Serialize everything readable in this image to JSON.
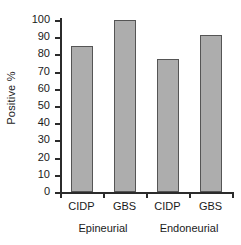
{
  "chart_data": {
    "type": "bar",
    "title": "",
    "xlabel": "",
    "ylabel": "Positive %",
    "ylim": [
      0,
      100
    ],
    "grid": false,
    "legend": "none",
    "categories": [
      "CIDP",
      "GBS",
      "CIDP",
      "GBS"
    ],
    "groups": [
      {
        "label": "Epineurial",
        "categories": [
          "CIDP",
          "GBS"
        ],
        "values": [
          85,
          100
        ]
      },
      {
        "label": "Endoneurial",
        "categories": [
          "CIDP",
          "GBS"
        ],
        "values": [
          77.5,
          91
        ]
      }
    ],
    "values": [
      85,
      100,
      77.5,
      91
    ],
    "bars": [
      {
        "category": "CIDP",
        "group": "Epineurial",
        "value": 85
      },
      {
        "category": "GBS",
        "group": "Epineurial",
        "value": 100
      },
      {
        "category": "CIDP",
        "group": "Endoneurial",
        "value": 77.5
      },
      {
        "category": "GBS",
        "group": "Endoneurial",
        "value": 91
      }
    ],
    "yticks": [
      100,
      90,
      80,
      70,
      60,
      50,
      40,
      30,
      20,
      10,
      0
    ],
    "ytick_labels": [
      "100",
      "90",
      "80",
      "70",
      "60",
      "50",
      "40",
      "30",
      "20",
      "10",
      "0"
    ],
    "colors": {
      "bar_fill": "#adadad",
      "bar_border": "#555555",
      "axis": "#2b2b2b",
      "text": "#1a1a1a",
      "background": "#ffffff"
    }
  },
  "axis": {
    "y_title": "Positive %"
  }
}
